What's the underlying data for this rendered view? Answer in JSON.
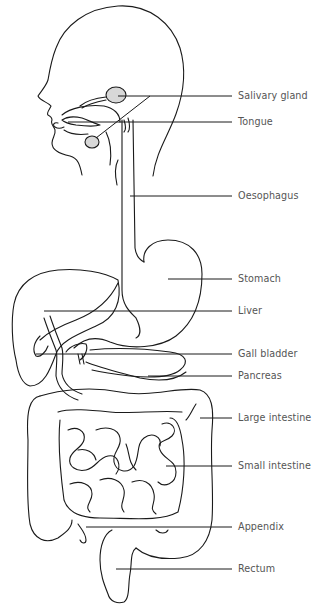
{
  "diagram": {
    "labels": [
      {
        "id": "salivary-gland",
        "text": "Salivary gland",
        "y": 96
      },
      {
        "id": "tongue",
        "text": "Tongue",
        "y": 122
      },
      {
        "id": "oesophagus",
        "text": "Oesophagus",
        "y": 196
      },
      {
        "id": "stomach",
        "text": "Stomach",
        "y": 279
      },
      {
        "id": "liver",
        "text": "Liver",
        "y": 311
      },
      {
        "id": "gall-bladder",
        "text": "Gall bladder",
        "y": 354
      },
      {
        "id": "pancreas",
        "text": "Pancreas",
        "y": 376
      },
      {
        "id": "large-intestine",
        "text": "Large intestine",
        "y": 418
      },
      {
        "id": "small-intestine",
        "text": "Small intestine",
        "y": 466
      },
      {
        "id": "appendix",
        "text": "Appendix",
        "y": 527
      },
      {
        "id": "rectum",
        "text": "Rectum",
        "y": 569
      }
    ],
    "colors": {
      "line": "#1a1a1a",
      "label_text": "#555555",
      "gland_fill": "#d8d8d8",
      "background": "#ffffff"
    }
  }
}
